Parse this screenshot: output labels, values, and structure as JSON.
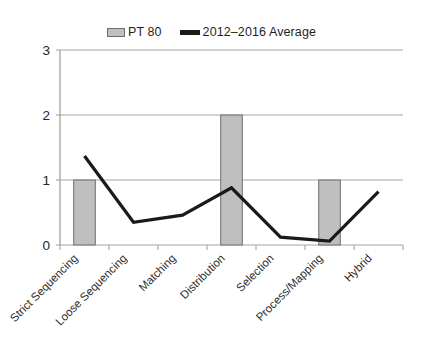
{
  "chart_data": {
    "type": "bar",
    "title": "",
    "xlabel": "",
    "ylabel": "",
    "ylim": [
      0,
      3
    ],
    "yticks": [
      0,
      1,
      2,
      3
    ],
    "grid": true,
    "legend_position": "top-center",
    "categories": [
      "Strict Sequencing",
      "Loose Sequencing",
      "Matching",
      "Distribution",
      "Selection",
      "Process/Mapping",
      "Hybrid"
    ],
    "series": [
      {
        "name": "PT 80",
        "type": "bar",
        "color": "#bfbfbf",
        "border_color": "#6e6e6e",
        "values": [
          1,
          0,
          0,
          2,
          0,
          1,
          0
        ]
      },
      {
        "name": "2012–2016 Average",
        "type": "line",
        "color": "#1a1a1a",
        "values": [
          1.37,
          0.35,
          0.46,
          0.88,
          0.12,
          0.06,
          0.82
        ]
      }
    ]
  },
  "legend": {
    "items": [
      {
        "label": "PT 80",
        "swatch": "bar-swatch-icon"
      },
      {
        "label": "2012–2016 Average",
        "swatch": "line-swatch-icon"
      }
    ]
  },
  "axis": {
    "y_tick_labels": [
      "3",
      "2",
      "1",
      "0"
    ]
  }
}
